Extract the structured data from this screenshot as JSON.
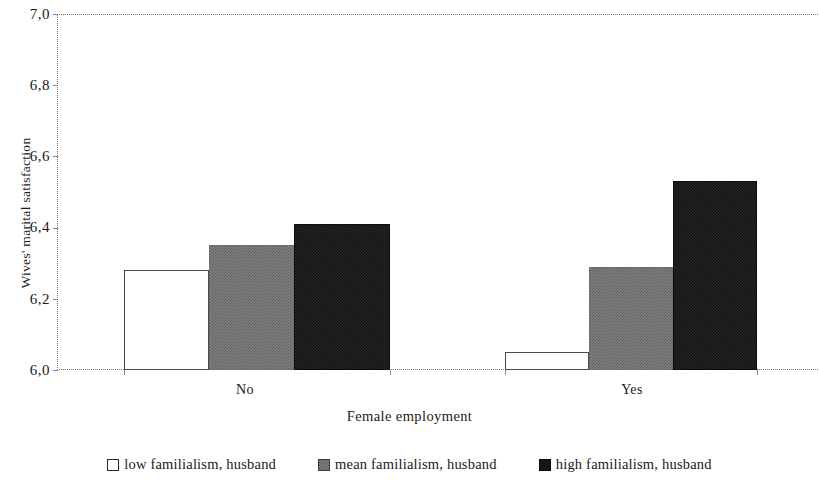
{
  "chart_data": {
    "type": "bar",
    "title": "",
    "xlabel": "Female employment",
    "ylabel": "Wives' marital satisfaction",
    "categories": [
      "No",
      "Yes"
    ],
    "series": [
      {
        "name": "low familialism, husband",
        "values": [
          6.28,
          6.05
        ],
        "color": "#ffffff"
      },
      {
        "name": "mean familialism, husband",
        "values": [
          6.35,
          6.29
        ],
        "color": "#808080"
      },
      {
        "name": "high familialism, husband",
        "values": [
          6.41,
          6.53
        ],
        "color": "#141414"
      }
    ],
    "ylim": [
      6.0,
      7.0
    ],
    "y_ticks": [
      "6,0",
      "6,2",
      "6,4",
      "6,6",
      "6,8",
      "7,0"
    ],
    "y_tick_values": [
      6.0,
      6.2,
      6.4,
      6.6,
      6.8,
      7.0
    ],
    "grid": false,
    "legend_position": "bottom"
  },
  "axes": {
    "y_title": "Wives' marital satisfaction",
    "x_title": "Female employment",
    "y_labels": [
      "7,0",
      "6,8",
      "6,6",
      "6,4",
      "6,2",
      "6,0"
    ],
    "x_labels": [
      "No",
      "Yes"
    ]
  },
  "legend": {
    "items": [
      {
        "label": "low familialism, husband"
      },
      {
        "label": "mean familialism, husband"
      },
      {
        "label": "high familialism, husband"
      }
    ]
  }
}
